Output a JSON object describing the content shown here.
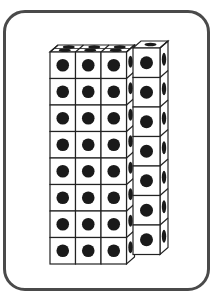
{
  "figure": {
    "main_block": {
      "columns": 3,
      "rows": 8,
      "depth": 2
    },
    "side_column": {
      "columns": 1,
      "rows": 7
    },
    "colors": {
      "border": "#4a4a4a",
      "line": "#222222",
      "dot": "#1a1a1a",
      "face": "#ffffff"
    }
  },
  "caption": ""
}
